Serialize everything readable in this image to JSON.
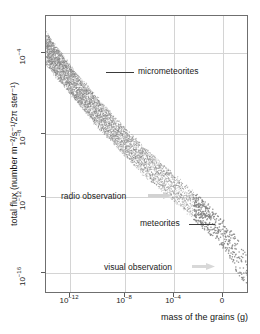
{
  "chart_data": {
    "type": "scatter",
    "title": "",
    "subtitle": "",
    "xlabel": "mass of the grains (g)",
    "ylabel": "total flux (number m⁻²/s⁻¹/2π ster⁻¹)",
    "x_scale": "log",
    "y_scale": "log",
    "grid": true,
    "legend_position": "none",
    "x_ticks": [
      {
        "label": "10⁻¹²",
        "mantissa": "10",
        "exponent": "-12",
        "value": 1e-12,
        "px": 69
      },
      {
        "label": "10⁻⁸",
        "mantissa": "10",
        "exponent": "-8",
        "value": 1e-08,
        "px": 124
      },
      {
        "label": "10⁻⁴",
        "mantissa": "10",
        "exponent": "-4",
        "value": 0.0001,
        "px": 173
      },
      {
        "label": "0",
        "mantissa": "0",
        "exponent": "",
        "value": 1,
        "px": 222
      }
    ],
    "y_ticks": [
      {
        "label": "10⁻⁴",
        "mantissa": "10",
        "exponent": "-4",
        "value": 0.0001,
        "px": 52
      },
      {
        "label": "10⁻⁸",
        "mantissa": "10",
        "exponent": "-8",
        "value": 1e-08,
        "px": 133
      },
      {
        "label": "10⁻¹²",
        "mantissa": "10",
        "exponent": "-12",
        "value": 1e-12,
        "px": 196
      },
      {
        "label": "10⁻¹⁶",
        "mantissa": "10",
        "exponent": "-16",
        "value": 1e-16,
        "px": 272
      }
    ],
    "xlim": [
      1e-14,
      100.0
    ],
    "ylim": [
      1e-18,
      0.01
    ],
    "band_description": "stippled band of flux versus grain mass, dense at upper left, sparse scattered dots at lower right",
    "band_upper": [
      {
        "x": 1e-14,
        "y": 0.002
      },
      {
        "x": 1e-12,
        "y": 2e-05
      },
      {
        "x": 1e-10,
        "y": 4e-07
      },
      {
        "x": 1e-08,
        "y": 1e-08
      },
      {
        "x": 1e-06,
        "y": 4e-10
      },
      {
        "x": 0.0001,
        "y": 2e-11
      },
      {
        "x": 0.01,
        "y": 1e-12
      },
      {
        "x": 1.0,
        "y": 4e-14
      },
      {
        "x": 100.0,
        "y": 2e-16
      }
    ],
    "band_lower": [
      {
        "x": 1e-14,
        "y": 3e-05
      },
      {
        "x": 1e-12,
        "y": 6e-07
      },
      {
        "x": 1e-10,
        "y": 1e-08
      },
      {
        "x": 1e-08,
        "y": 3e-10
      },
      {
        "x": 1e-06,
        "y": 1e-11
      },
      {
        "x": 0.0001,
        "y": 6e-13
      },
      {
        "x": 0.01,
        "y": 3e-14
      },
      {
        "x": 1.0,
        "y": 1e-15
      },
      {
        "x": 100.0,
        "y": 2e-18
      }
    ],
    "annotations": [
      {
        "id": "micrometeorites",
        "text": "micrometeorites",
        "has_leader": true,
        "leader_side": "left"
      },
      {
        "id": "meteorites",
        "text": "meteorites",
        "has_leader": true,
        "leader_side": "right"
      },
      {
        "id": "radio-observation",
        "text": "radio observation",
        "has_arrow": true,
        "arrow_direction": "right"
      },
      {
        "id": "visual-observation",
        "text": "visual observation",
        "has_arrow": true,
        "arrow_direction": "right"
      }
    ],
    "colors": {
      "background": "#ffffff",
      "frame": "#6f6f6f",
      "grid": "#d4d4d4",
      "stipple": "#808080",
      "text": "#1a1a1a",
      "arrow": "#d0d0d0",
      "leader": "#3a3a3a"
    }
  }
}
